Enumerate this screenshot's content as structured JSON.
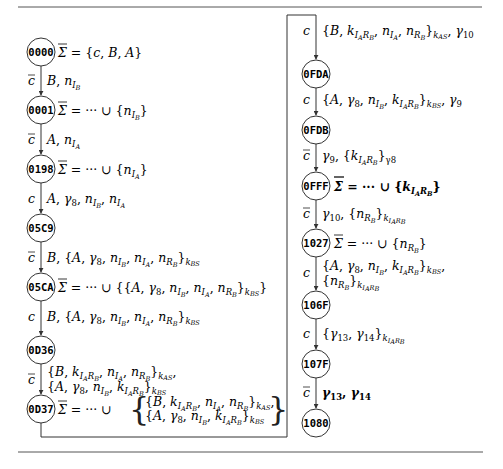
{
  "rules": {
    "color": "#555555"
  },
  "left_column": {
    "nodes": [
      {
        "id": "0000",
        "sigma": "= {c, B, A}"
      },
      {
        "id": "0001",
        "sigma": "= ··· ∪ {n_IB}"
      },
      {
        "id": "0198",
        "sigma": "= ··· ∪ {n_IA}"
      },
      {
        "id": "05C9",
        "sigma": ""
      },
      {
        "id": "05CA",
        "sigma": "= ··· ∪ {{A, γ8, n_IB, n_IA, n_RB}_kBS}"
      },
      {
        "id": "0D36",
        "sigma": ""
      },
      {
        "id": "0D37",
        "sigma": "= ··· ∪ { {B, k_IARB, n_IA, n_RB}_kAS, {A, γ8, n_IB, k_IARB}_kBS }"
      }
    ],
    "edges": [
      {
        "channel": "c̄",
        "message": "B, n_IB"
      },
      {
        "channel": "c̄",
        "message": "A, n_IA"
      },
      {
        "channel": "c",
        "message": "A, γ8, n_IB, n_IA"
      },
      {
        "channel": "c̄",
        "message": "B, {A, γ8, n_IB, n_IA, n_RB}_kBS"
      },
      {
        "channel": "c",
        "message": "B, {A, γ8, n_IB, n_IA, n_RB}_kBS"
      },
      {
        "channel": "c̄",
        "message": "{B, k_IARB, n_IA, n_RB}_kAS, {A, γ8, n_IB, k_IARB}_kBS"
      }
    ]
  },
  "right_column": {
    "nodes": [
      {
        "id": "0FDA",
        "sigma": ""
      },
      {
        "id": "0FDB",
        "sigma": ""
      },
      {
        "id": "0FFF",
        "sigma": "= ··· ∪ {k_IARB}",
        "bold": true
      },
      {
        "id": "1027",
        "sigma": "= ··· ∪ {n_RB}"
      },
      {
        "id": "106F",
        "sigma": ""
      },
      {
        "id": "107F",
        "sigma": ""
      },
      {
        "id": "1080",
        "sigma": ""
      }
    ],
    "edges": [
      {
        "channel": "c",
        "message": "{B, k_IARB, n_IA, n_RB}_kAS, γ10",
        "from": "0D37",
        "to": "0FDA"
      },
      {
        "channel": "c",
        "message": "{A, γ8, n_IB, k_IARB}_kBS, γ9"
      },
      {
        "channel": "c̄",
        "message": "γ9, {k_IARB}_γ8"
      },
      {
        "channel": "c̄",
        "message": "γ10, {n_RB}_k_IARB"
      },
      {
        "channel": "c",
        "message": "{A, γ8, n_IB, k_IARB}_kBS, {n_RB}_k_IARB"
      },
      {
        "channel": "c",
        "message": "{γ13, γ14}_k_IARB"
      },
      {
        "channel": "c̄",
        "message": "γ13, γ14",
        "bold": true
      }
    ]
  },
  "symbols": {
    "sigma_bar": "Σ",
    "c": "c",
    "ellipsis_union": "= ··· ∪ "
  }
}
